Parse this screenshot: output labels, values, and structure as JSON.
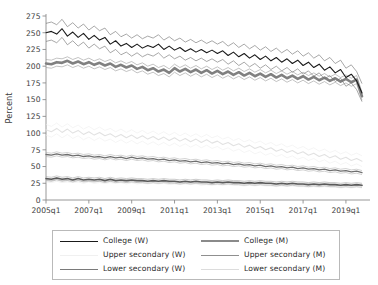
{
  "chart_data": {
    "type": "line",
    "title": "",
    "xlabel": "",
    "ylabel": "Percent",
    "ylim": [
      0,
      275
    ],
    "yticks": [
      0,
      25,
      50,
      75,
      100,
      125,
      150,
      175,
      200,
      225,
      250,
      275
    ],
    "ytick_labels": [
      "0",
      "25",
      "50",
      "75",
      "100",
      "125",
      "150",
      "175",
      "200",
      "225",
      "250",
      "275"
    ],
    "xticks": [
      "2005q1",
      "2007q1",
      "2009q1",
      "2011q1",
      "2013q1",
      "2015q1",
      "2017q1",
      "2019q1"
    ],
    "xtick_labels": [
      "2005q1",
      "2007q1",
      "2009q1",
      "2011q1",
      "2013q1",
      "2015q1",
      "2017q1",
      "2019q1"
    ],
    "x_start": "2005q1",
    "x_end": "2019q4",
    "x_unit": "quarter",
    "n_points": 60,
    "grid": false,
    "legend_position": "bottom",
    "series": [
      {
        "name": "College (W)",
        "color": "#1a1a1a",
        "width": 1.1,
        "band_color": "#6d6d6d",
        "band_width": 0.6,
        "values": [
          250,
          252,
          248,
          256,
          245,
          251,
          243,
          249,
          240,
          246,
          239,
          243,
          233,
          238,
          230,
          234,
          228,
          233,
          227,
          231,
          228,
          233,
          225,
          230,
          224,
          228,
          222,
          226,
          221,
          225,
          220,
          224,
          219,
          223,
          216,
          221,
          214,
          219,
          212,
          217,
          210,
          215,
          208,
          213,
          206,
          211,
          204,
          209,
          201,
          206,
          198,
          203,
          194,
          199,
          190,
          195,
          183,
          188,
          178,
          160
        ],
        "upper": [
          264,
          266,
          262,
          270,
          259,
          265,
          257,
          263,
          254,
          260,
          253,
          257,
          247,
          252,
          244,
          248,
          242,
          247,
          241,
          245,
          242,
          247,
          239,
          244,
          238,
          242,
          236,
          240,
          235,
          239,
          234,
          238,
          233,
          237,
          230,
          235,
          228,
          233,
          226,
          231,
          224,
          229,
          222,
          227,
          220,
          225,
          218,
          223,
          215,
          220,
          212,
          217,
          208,
          213,
          204,
          209,
          197,
          202,
          192,
          174
        ],
        "lower": [
          237,
          239,
          235,
          243,
          232,
          238,
          230,
          236,
          227,
          233,
          226,
          230,
          220,
          225,
          217,
          221,
          215,
          220,
          214,
          218,
          215,
          220,
          212,
          217,
          211,
          215,
          209,
          213,
          208,
          212,
          207,
          211,
          206,
          210,
          203,
          208,
          201,
          206,
          199,
          204,
          197,
          202,
          195,
          200,
          193,
          198,
          191,
          196,
          188,
          193,
          185,
          190,
          181,
          186,
          177,
          182,
          170,
          175,
          165,
          147
        ]
      },
      {
        "name": "College (M)",
        "color": "#808080",
        "width": 2.6,
        "band_color": "#9b9b9b",
        "band_width": 0.6,
        "values": [
          204,
          203,
          206,
          205,
          208,
          204,
          207,
          203,
          206,
          202,
          205,
          201,
          204,
          199,
          202,
          198,
          201,
          196,
          199,
          194,
          197,
          192,
          195,
          190,
          197,
          192,
          196,
          191,
          195,
          190,
          194,
          189,
          193,
          188,
          192,
          187,
          191,
          186,
          190,
          185,
          189,
          184,
          188,
          183,
          187,
          182,
          186,
          181,
          185,
          180,
          184,
          179,
          183,
          178,
          182,
          177,
          181,
          176,
          180,
          155
        ],
        "upper": [
          210,
          209,
          212,
          211,
          214,
          210,
          213,
          209,
          212,
          208,
          211,
          207,
          210,
          205,
          208,
          204,
          207,
          202,
          205,
          200,
          203,
          198,
          201,
          196,
          203,
          198,
          202,
          197,
          201,
          196,
          200,
          195,
          199,
          194,
          198,
          193,
          197,
          192,
          196,
          191,
          195,
          190,
          194,
          189,
          193,
          188,
          192,
          187,
          191,
          186,
          190,
          185,
          189,
          184,
          188,
          183,
          187,
          182,
          186,
          161
        ],
        "lower": [
          198,
          197,
          200,
          199,
          202,
          198,
          201,
          197,
          200,
          196,
          199,
          195,
          198,
          193,
          196,
          192,
          195,
          190,
          193,
          188,
          191,
          186,
          189,
          184,
          191,
          186,
          190,
          185,
          189,
          184,
          188,
          183,
          187,
          182,
          186,
          181,
          185,
          180,
          184,
          179,
          183,
          178,
          182,
          177,
          181,
          176,
          180,
          175,
          179,
          174,
          178,
          173,
          177,
          172,
          176,
          171,
          175,
          170,
          174,
          149
        ]
      },
      {
        "name": "Upper secondary (W)",
        "color": "#e2e2e2",
        "width": 1.1,
        "band_color": "#eeeeee",
        "band_width": 0.6,
        "values": [
          105,
          102,
          107,
          101,
          106,
          100,
          104,
          98,
          102,
          97,
          101,
          96,
          99,
          94,
          98,
          93,
          97,
          92,
          96,
          91,
          95,
          90,
          94,
          89,
          93,
          88,
          92,
          87,
          91,
          86,
          90,
          85,
          88,
          83,
          86,
          81,
          84,
          79,
          82,
          77,
          80,
          75,
          78,
          73,
          76,
          71,
          74,
          69,
          72,
          67,
          70,
          65,
          68,
          63,
          66,
          61,
          64,
          59,
          62,
          58
        ],
        "upper": [
          113,
          110,
          115,
          109,
          114,
          108,
          112,
          106,
          110,
          105,
          109,
          104,
          107,
          102,
          106,
          101,
          105,
          100,
          104,
          99,
          103,
          98,
          102,
          97,
          101,
          96,
          100,
          95,
          99,
          94,
          98,
          93,
          96,
          91,
          94,
          89,
          92,
          87,
          90,
          85,
          88,
          83,
          86,
          81,
          84,
          79,
          82,
          77,
          80,
          75,
          78,
          73,
          76,
          71,
          74,
          69,
          72,
          67,
          70,
          66
        ],
        "lower": [
          97,
          94,
          99,
          93,
          98,
          92,
          96,
          90,
          94,
          89,
          93,
          88,
          91,
          86,
          90,
          85,
          89,
          84,
          88,
          83,
          87,
          82,
          86,
          81,
          85,
          80,
          84,
          79,
          83,
          78,
          82,
          77,
          80,
          75,
          78,
          73,
          76,
          71,
          74,
          69,
          72,
          67,
          70,
          65,
          68,
          63,
          66,
          61,
          64,
          59,
          62,
          57,
          60,
          55,
          58,
          53,
          56,
          51,
          54,
          50
        ]
      },
      {
        "name": "Upper secondary (M)",
        "color": "#6f6f6f",
        "width": 1.3,
        "band_color": "#a5a5a5",
        "band_width": 0.5,
        "values": [
          68,
          67,
          69,
          67,
          68,
          66,
          67,
          65,
          66,
          64,
          65,
          63,
          65,
          63,
          64,
          62,
          64,
          62,
          63,
          61,
          62,
          60,
          61,
          59,
          60,
          58,
          59,
          57,
          58,
          56,
          57,
          55,
          56,
          54,
          55,
          53,
          54,
          52,
          53,
          51,
          52,
          50,
          51,
          49,
          50,
          48,
          49,
          47,
          48,
          46,
          47,
          45,
          46,
          44,
          45,
          43,
          44,
          42,
          43,
          41
        ],
        "upper": [
          71,
          70,
          72,
          70,
          71,
          69,
          70,
          68,
          69,
          67,
          68,
          66,
          68,
          66,
          67,
          65,
          67,
          65,
          66,
          64,
          65,
          63,
          64,
          62,
          63,
          61,
          62,
          60,
          61,
          59,
          60,
          58,
          59,
          57,
          58,
          56,
          57,
          55,
          56,
          54,
          55,
          53,
          54,
          52,
          53,
          51,
          52,
          50,
          51,
          49,
          50,
          48,
          49,
          47,
          48,
          46,
          47,
          45,
          46,
          44
        ],
        "lower": [
          65,
          64,
          66,
          64,
          65,
          63,
          64,
          62,
          63,
          61,
          62,
          60,
          62,
          60,
          61,
          59,
          61,
          59,
          60,
          58,
          59,
          57,
          58,
          56,
          57,
          55,
          56,
          54,
          55,
          53,
          54,
          52,
          53,
          51,
          52,
          50,
          51,
          49,
          50,
          48,
          49,
          47,
          48,
          46,
          47,
          45,
          46,
          44,
          45,
          43,
          44,
          42,
          43,
          41,
          42,
          40,
          41,
          39,
          40,
          38
        ]
      },
      {
        "name": "Lower secondary (W)",
        "color": "#5a5a5a",
        "width": 1.6,
        "band_color": "#9a9a9a",
        "band_width": 0.5,
        "values": [
          32,
          31,
          33,
          31,
          32,
          30,
          32,
          30,
          31,
          30,
          31,
          29,
          31,
          29,
          30,
          29,
          30,
          29,
          29,
          28,
          29,
          28,
          29,
          28,
          28,
          27,
          28,
          27,
          28,
          27,
          27,
          26,
          27,
          26,
          27,
          26,
          26,
          25,
          26,
          25,
          26,
          25,
          25,
          24,
          25,
          24,
          25,
          24,
          24,
          23,
          24,
          23,
          24,
          23,
          23,
          22,
          23,
          22,
          23,
          22
        ],
        "upper": [
          35,
          34,
          36,
          34,
          35,
          33,
          35,
          33,
          34,
          33,
          34,
          32,
          34,
          32,
          33,
          32,
          33,
          32,
          32,
          31,
          32,
          31,
          32,
          31,
          31,
          30,
          31,
          30,
          31,
          30,
          30,
          29,
          30,
          29,
          30,
          29,
          29,
          28,
          29,
          28,
          29,
          28,
          28,
          27,
          28,
          27,
          28,
          27,
          27,
          26,
          27,
          26,
          27,
          26,
          26,
          25,
          26,
          25,
          26,
          25
        ],
        "lower": [
          29,
          28,
          30,
          28,
          29,
          27,
          29,
          27,
          28,
          27,
          28,
          26,
          28,
          26,
          27,
          26,
          27,
          26,
          26,
          25,
          26,
          25,
          26,
          25,
          25,
          24,
          25,
          24,
          25,
          24,
          24,
          23,
          24,
          23,
          24,
          23,
          23,
          22,
          23,
          22,
          23,
          22,
          22,
          21,
          22,
          21,
          22,
          21,
          21,
          20,
          21,
          20,
          21,
          20,
          20,
          19,
          20,
          19,
          20,
          19
        ]
      },
      {
        "name": "Lower secondary (M)",
        "color": "#d0d0d0",
        "width": 1.1,
        "band_color": "#e4e4e4",
        "band_width": 0.5,
        "values": [
          30,
          29,
          31,
          29,
          30,
          29,
          30,
          28,
          30,
          28,
          29,
          28,
          29,
          28,
          29,
          27,
          29,
          27,
          28,
          27,
          28,
          27,
          28,
          26,
          27,
          26,
          27,
          26,
          27,
          25,
          26,
          25,
          26,
          25,
          26,
          25,
          25,
          24,
          25,
          24,
          25,
          24,
          24,
          23,
          24,
          23,
          24,
          23,
          23,
          22,
          23,
          22,
          23,
          22,
          22,
          21,
          22,
          21,
          22,
          21
        ],
        "upper": [
          33,
          32,
          34,
          32,
          33,
          32,
          33,
          31,
          33,
          31,
          32,
          31,
          32,
          31,
          32,
          30,
          32,
          30,
          31,
          30,
          31,
          30,
          31,
          29,
          30,
          29,
          30,
          29,
          30,
          28,
          29,
          28,
          29,
          28,
          29,
          28,
          28,
          27,
          28,
          27,
          28,
          27,
          27,
          26,
          27,
          26,
          27,
          26,
          26,
          25,
          26,
          25,
          26,
          25,
          25,
          24,
          25,
          24,
          25,
          24
        ],
        "lower": [
          27,
          26,
          28,
          26,
          27,
          26,
          27,
          25,
          27,
          25,
          26,
          25,
          26,
          25,
          26,
          24,
          26,
          24,
          25,
          24,
          25,
          24,
          25,
          23,
          24,
          23,
          24,
          23,
          24,
          22,
          23,
          22,
          23,
          22,
          23,
          22,
          22,
          21,
          22,
          21,
          22,
          21,
          21,
          20,
          21,
          20,
          21,
          20,
          20,
          19,
          20,
          19,
          20,
          19,
          19,
          18,
          19,
          18,
          19,
          18
        ]
      }
    ]
  },
  "legend": {
    "items": [
      {
        "label": "College (W)",
        "color": "#1a1a1a",
        "width": 1.4
      },
      {
        "label": "College (M)",
        "color": "#8a8a8a",
        "width": 2.2
      },
      {
        "label": "Upper secondary (W)",
        "color": "#f0f0f0",
        "width": 1.2
      },
      {
        "label": "Upper secondary (M)",
        "color": "#8f8f8f",
        "width": 1.1
      },
      {
        "label": "Lower secondary (W)",
        "color": "#7a7a7a",
        "width": 1.6
      },
      {
        "label": "Lower secondary (M)",
        "color": "#dcdcdc",
        "width": 1.2
      }
    ]
  },
  "axis": {
    "y_label": "Percent"
  }
}
